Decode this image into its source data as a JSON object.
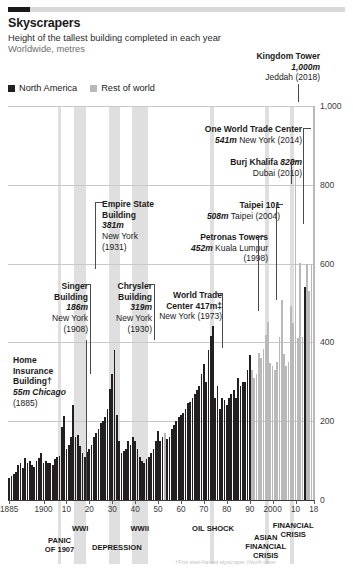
{
  "header": {
    "title": "Skyscrapers",
    "subtitle1": "Height of the tallest building completed in each year",
    "subtitle2": "Worldwide, metres"
  },
  "legend": {
    "items": [
      {
        "label": "North America",
        "color": "#231f20"
      },
      {
        "label": "Rest of world",
        "color": "#b9b9b9"
      }
    ]
  },
  "annotations": [
    {
      "name": "kingdom-tower",
      "title": "Kingdom Tower",
      "value": "1,000m",
      "place": "Jeddah (2018)"
    },
    {
      "name": "one-wtc",
      "title": "One World Trade Center",
      "value": "541m",
      "place": "New York (2014)"
    },
    {
      "name": "burj-khalifa",
      "title": "Burj Khalifa",
      "value": "828m",
      "place": "Dubai (2010)"
    },
    {
      "name": "taipei-101",
      "title": "Taipei 101",
      "value": "508m",
      "place": "Taipei (2004)"
    },
    {
      "name": "petronas",
      "title": "Petronas Towers",
      "value": "452m",
      "place": "Kuala Lumpur (1998)"
    },
    {
      "name": "empire-state",
      "title": "Empire State Building",
      "value": "381m",
      "place": "New York (1931)"
    },
    {
      "name": "singer",
      "title": "Singer Building",
      "value": "186m",
      "place": "New York (1908)"
    },
    {
      "name": "chrysler",
      "title": "Chrysler Building",
      "value": "319m",
      "place": "New York (1930)"
    },
    {
      "name": "world-trade-center",
      "title": "World Trade Center",
      "value": "417m‡",
      "place": "New York (1973)"
    },
    {
      "name": "home-insurance",
      "title": "Home Insurance Building†",
      "value": "55m",
      "place": "Chicago (1885)"
    }
  ],
  "anno_text": {
    "kingdom_l1": "Kingdom Tower",
    "kingdom_l2": "1,000m",
    "kingdom_l3": "Jeddah (2018)",
    "onewtc_l1": "One World Trade Center",
    "onewtc_l2": "541m",
    "onewtc_l2b": " New York (2014)",
    "burj_l1": "Burj Khalifa ",
    "burj_l1b": "828m",
    "burj_l2": "Dubai (2010)",
    "taipei_l1": "Taipei 101",
    "taipei_l2": "508m",
    "taipei_l2b": " Taipei (2004)",
    "petronas_l1": "Petronas Towers",
    "petronas_l2": "452m",
    "petronas_l2b": " Kuala Lumpur",
    "petronas_l3": "(1998)",
    "empire_l1": "Empire State",
    "empire_l2": "Building",
    "empire_l3": "381m",
    "empire_l4": "New York",
    "empire_l5": "(1931)",
    "singer_l1": "Singer",
    "singer_l2": "Building",
    "singer_l3": "186m",
    "singer_l4": "New York",
    "singer_l5": "(1908)",
    "chrysler_l1": "Chrysler",
    "chrysler_l2": "Building",
    "chrysler_l3": "319m",
    "chrysler_l4": "New York",
    "chrysler_l5": "(1930)",
    "wtc_l1": "World Trade",
    "wtc_l2": "Center 417m‡",
    "wtc_l3": "New York (1973)",
    "home_l1": "Home",
    "home_l2": "Insurance",
    "home_l3": "Building†",
    "home_l4": "55m Chicago",
    "home_l5": "(1885)"
  },
  "events": [
    {
      "label": "PANIC\nOF 1907",
      "year": 1907
    },
    {
      "label": "WWI",
      "year": 1916
    },
    {
      "label": "DEPRESSION",
      "year": 1932
    },
    {
      "label": "WWII",
      "year": 1942
    },
    {
      "label": "OIL SHOCK",
      "year": 1974
    },
    {
      "label": "ASIAN\nFINANCIAL\nCRISIS",
      "year": 1997
    },
    {
      "label": "FINANCIAL\nCRISIS",
      "year": 2009
    }
  ],
  "footnote": "†First steel-framed skyscraper  ‡North tower",
  "chart_data": {
    "type": "bar",
    "title": "Skyscrapers",
    "subtitle": "Height of the tallest building completed in each year",
    "ylabel": "Worldwide, metres",
    "xlabel": "",
    "ylim": [
      0,
      1000
    ],
    "yticks": [
      0,
      200,
      400,
      600,
      800,
      1000
    ],
    "ytick_labels": [
      "0",
      "200",
      "400",
      "600",
      "800",
      "1,000"
    ],
    "xlim": [
      1885,
      2018
    ],
    "xticks": [
      1885,
      1900,
      1910,
      1920,
      1930,
      1940,
      1950,
      1960,
      1970,
      1980,
      1990,
      2000,
      2010,
      2018
    ],
    "xtick_labels": [
      "1885",
      "1900",
      "10",
      "20",
      "30",
      "40",
      "50",
      "60",
      "70",
      "80",
      "90",
      "2000",
      "10",
      "18"
    ],
    "grid": "horizontal",
    "legend_position": "top-left",
    "series": [
      {
        "name": "North America",
        "color": "#231f20"
      },
      {
        "name": "Rest of world",
        "color": "#b9b9b9"
      }
    ],
    "points": [
      {
        "year": 1885,
        "value": 55,
        "region": "North America"
      },
      {
        "year": 1886,
        "value": 60,
        "region": "North America"
      },
      {
        "year": 1887,
        "value": 65,
        "region": "North America"
      },
      {
        "year": 1888,
        "value": 70,
        "region": "North America"
      },
      {
        "year": 1889,
        "value": 90,
        "region": "North America"
      },
      {
        "year": 1890,
        "value": 94,
        "region": "North America"
      },
      {
        "year": 1891,
        "value": 80,
        "region": "North America"
      },
      {
        "year": 1892,
        "value": 106,
        "region": "North America"
      },
      {
        "year": 1893,
        "value": 93,
        "region": "North America"
      },
      {
        "year": 1894,
        "value": 100,
        "region": "North America"
      },
      {
        "year": 1895,
        "value": 90,
        "region": "North America"
      },
      {
        "year": 1896,
        "value": 85,
        "region": "North America"
      },
      {
        "year": 1897,
        "value": 100,
        "region": "North America"
      },
      {
        "year": 1898,
        "value": 106,
        "region": "North America"
      },
      {
        "year": 1899,
        "value": 119,
        "region": "North America"
      },
      {
        "year": 1900,
        "value": 95,
        "region": "North America"
      },
      {
        "year": 1901,
        "value": 100,
        "region": "North America"
      },
      {
        "year": 1902,
        "value": 94,
        "region": "North America"
      },
      {
        "year": 1903,
        "value": 95,
        "region": "North America"
      },
      {
        "year": 1904,
        "value": 90,
        "region": "North America"
      },
      {
        "year": 1905,
        "value": 103,
        "region": "North America"
      },
      {
        "year": 1906,
        "value": 110,
        "region": "North America"
      },
      {
        "year": 1907,
        "value": 112,
        "region": "North America"
      },
      {
        "year": 1908,
        "value": 186,
        "region": "North America"
      },
      {
        "year": 1909,
        "value": 213,
        "region": "North America"
      },
      {
        "year": 1910,
        "value": 130,
        "region": "North America"
      },
      {
        "year": 1911,
        "value": 140,
        "region": "North America"
      },
      {
        "year": 1912,
        "value": 160,
        "region": "North America"
      },
      {
        "year": 1913,
        "value": 241,
        "region": "North America"
      },
      {
        "year": 1914,
        "value": 160,
        "region": "North America"
      },
      {
        "year": 1915,
        "value": 164,
        "region": "North America"
      },
      {
        "year": 1916,
        "value": 138,
        "region": "North America"
      },
      {
        "year": 1917,
        "value": 120,
        "region": "North America"
      },
      {
        "year": 1918,
        "value": 110,
        "region": "North America"
      },
      {
        "year": 1919,
        "value": 122,
        "region": "North America"
      },
      {
        "year": 1920,
        "value": 130,
        "region": "North America"
      },
      {
        "year": 1921,
        "value": 140,
        "region": "North America"
      },
      {
        "year": 1922,
        "value": 160,
        "region": "North America"
      },
      {
        "year": 1923,
        "value": 170,
        "region": "North America"
      },
      {
        "year": 1924,
        "value": 180,
        "region": "North America"
      },
      {
        "year": 1925,
        "value": 195,
        "region": "North America"
      },
      {
        "year": 1926,
        "value": 200,
        "region": "North America"
      },
      {
        "year": 1927,
        "value": 210,
        "region": "North America"
      },
      {
        "year": 1928,
        "value": 232,
        "region": "North America"
      },
      {
        "year": 1929,
        "value": 283,
        "region": "North America"
      },
      {
        "year": 1930,
        "value": 319,
        "region": "North America"
      },
      {
        "year": 1931,
        "value": 381,
        "region": "North America"
      },
      {
        "year": 1932,
        "value": 216,
        "region": "North America"
      },
      {
        "year": 1933,
        "value": 150,
        "region": "North America"
      },
      {
        "year": 1934,
        "value": 120,
        "region": "North America"
      },
      {
        "year": 1935,
        "value": 125,
        "region": "North America"
      },
      {
        "year": 1936,
        "value": 130,
        "region": "North America"
      },
      {
        "year": 1937,
        "value": 150,
        "region": "North America"
      },
      {
        "year": 1938,
        "value": 140,
        "region": "North America"
      },
      {
        "year": 1939,
        "value": 160,
        "region": "North America"
      },
      {
        "year": 1940,
        "value": 150,
        "region": "North America"
      },
      {
        "year": 1941,
        "value": 130,
        "region": "North America"
      },
      {
        "year": 1942,
        "value": 110,
        "region": "North America"
      },
      {
        "year": 1943,
        "value": 100,
        "region": "North America"
      },
      {
        "year": 1944,
        "value": 95,
        "region": "North America"
      },
      {
        "year": 1945,
        "value": 105,
        "region": "North America"
      },
      {
        "year": 1946,
        "value": 110,
        "region": "North America"
      },
      {
        "year": 1947,
        "value": 120,
        "region": "North America"
      },
      {
        "year": 1948,
        "value": 130,
        "region": "North America"
      },
      {
        "year": 1949,
        "value": 150,
        "region": "North America"
      },
      {
        "year": 1950,
        "value": 176,
        "region": "North America"
      },
      {
        "year": 1951,
        "value": 150,
        "region": "North America"
      },
      {
        "year": 1952,
        "value": 160,
        "region": "North America"
      },
      {
        "year": 1953,
        "value": 170,
        "region": "Rest of world"
      },
      {
        "year": 1954,
        "value": 155,
        "region": "North America"
      },
      {
        "year": 1955,
        "value": 160,
        "region": "North America"
      },
      {
        "year": 1956,
        "value": 180,
        "region": "North America"
      },
      {
        "year": 1957,
        "value": 190,
        "region": "North America"
      },
      {
        "year": 1958,
        "value": 200,
        "region": "North America"
      },
      {
        "year": 1959,
        "value": 210,
        "region": "North America"
      },
      {
        "year": 1960,
        "value": 215,
        "region": "North America"
      },
      {
        "year": 1961,
        "value": 220,
        "region": "North America"
      },
      {
        "year": 1962,
        "value": 230,
        "region": "North America"
      },
      {
        "year": 1963,
        "value": 245,
        "region": "North America"
      },
      {
        "year": 1964,
        "value": 250,
        "region": "North America"
      },
      {
        "year": 1965,
        "value": 260,
        "region": "North America"
      },
      {
        "year": 1966,
        "value": 270,
        "region": "North America"
      },
      {
        "year": 1967,
        "value": 280,
        "region": "North America"
      },
      {
        "year": 1968,
        "value": 290,
        "region": "North America"
      },
      {
        "year": 1969,
        "value": 320,
        "region": "North America"
      },
      {
        "year": 1970,
        "value": 344,
        "region": "North America"
      },
      {
        "year": 1971,
        "value": 300,
        "region": "North America"
      },
      {
        "year": 1972,
        "value": 380,
        "region": "North America"
      },
      {
        "year": 1973,
        "value": 417,
        "region": "North America"
      },
      {
        "year": 1974,
        "value": 442,
        "region": "North America"
      },
      {
        "year": 1975,
        "value": 260,
        "region": "North America"
      },
      {
        "year": 1976,
        "value": 290,
        "region": "North America"
      },
      {
        "year": 1977,
        "value": 230,
        "region": "North America"
      },
      {
        "year": 1978,
        "value": 260,
        "region": "North America"
      },
      {
        "year": 1979,
        "value": 255,
        "region": "North America"
      },
      {
        "year": 1980,
        "value": 240,
        "region": "North America"
      },
      {
        "year": 1981,
        "value": 260,
        "region": "North America"
      },
      {
        "year": 1982,
        "value": 270,
        "region": "North America"
      },
      {
        "year": 1983,
        "value": 280,
        "region": "North America"
      },
      {
        "year": 1984,
        "value": 260,
        "region": "North America"
      },
      {
        "year": 1985,
        "value": 310,
        "region": "North America"
      },
      {
        "year": 1986,
        "value": 290,
        "region": "North America"
      },
      {
        "year": 1987,
        "value": 300,
        "region": "North America"
      },
      {
        "year": 1988,
        "value": 300,
        "region": "North America"
      },
      {
        "year": 1989,
        "value": 330,
        "region": "North America"
      },
      {
        "year": 1990,
        "value": 369,
        "region": "North America"
      },
      {
        "year": 1991,
        "value": 330,
        "region": "Rest of world"
      },
      {
        "year": 1992,
        "value": 310,
        "region": "Rest of world"
      },
      {
        "year": 1993,
        "value": 320,
        "region": "Rest of world"
      },
      {
        "year": 1994,
        "value": 374,
        "region": "Rest of world"
      },
      {
        "year": 1995,
        "value": 360,
        "region": "Rest of world"
      },
      {
        "year": 1996,
        "value": 384,
        "region": "Rest of world"
      },
      {
        "year": 1997,
        "value": 420,
        "region": "Rest of world"
      },
      {
        "year": 1998,
        "value": 452,
        "region": "Rest of world"
      },
      {
        "year": 1999,
        "value": 348,
        "region": "Rest of world"
      },
      {
        "year": 2000,
        "value": 340,
        "region": "Rest of world"
      },
      {
        "year": 2001,
        "value": 330,
        "region": "Rest of world"
      },
      {
        "year": 2002,
        "value": 350,
        "region": "Rest of world"
      },
      {
        "year": 2003,
        "value": 415,
        "region": "Rest of world"
      },
      {
        "year": 2004,
        "value": 508,
        "region": "Rest of world"
      },
      {
        "year": 2005,
        "value": 370,
        "region": "Rest of world"
      },
      {
        "year": 2006,
        "value": 340,
        "region": "Rest of world"
      },
      {
        "year": 2007,
        "value": 350,
        "region": "Rest of world"
      },
      {
        "year": 2008,
        "value": 492,
        "region": "Rest of world"
      },
      {
        "year": 2009,
        "value": 450,
        "region": "Rest of world"
      },
      {
        "year": 2010,
        "value": 828,
        "region": "Rest of world"
      },
      {
        "year": 2011,
        "value": 412,
        "region": "Rest of world"
      },
      {
        "year": 2012,
        "value": 601,
        "region": "Rest of world"
      },
      {
        "year": 2013,
        "value": 413,
        "region": "Rest of world"
      },
      {
        "year": 2014,
        "value": 541,
        "region": "North America"
      },
      {
        "year": 2015,
        "value": 599,
        "region": "Rest of world"
      },
      {
        "year": 2016,
        "value": 530,
        "region": "Rest of world"
      },
      {
        "year": 2017,
        "value": 599,
        "region": "Rest of world"
      },
      {
        "year": 2018,
        "value": 1000,
        "region": "Rest of world"
      }
    ]
  }
}
